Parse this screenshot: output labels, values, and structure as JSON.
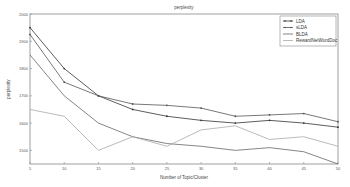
{
  "chart_data": {
    "type": "line",
    "title": "perplexity",
    "xlabel": "Number of Topic/Cluster",
    "ylabel": "perplexity",
    "x": [
      5,
      10,
      15,
      20,
      25,
      30,
      35,
      40,
      45,
      50
    ],
    "xlim": [
      5,
      50
    ],
    "ylim": [
      1450,
      2000
    ],
    "yticks": [
      1500,
      1600,
      1700,
      1800,
      1900,
      2000
    ],
    "xticks": [
      5,
      10,
      15,
      20,
      25,
      30,
      35,
      40,
      45,
      50
    ],
    "grid": false,
    "legend_position": "upper right",
    "series": [
      {
        "name": "LDA",
        "color": "#333333",
        "marker": "dot",
        "values": [
          1950,
          1800,
          1700,
          1650,
          1625,
          1610,
          1600,
          1610,
          1600,
          1585
        ]
      },
      {
        "name": "sLDA",
        "color": "#555555",
        "marker": "plus",
        "values": [
          1925,
          1750,
          1700,
          1670,
          1665,
          1655,
          1625,
          1630,
          1635,
          1605
        ]
      },
      {
        "name": "BLDA",
        "color": "#666666",
        "marker": "none",
        "values": [
          1850,
          1700,
          1600,
          1550,
          1525,
          1515,
          1500,
          1510,
          1495,
          1450
        ]
      },
      {
        "name": "RewardNetWordDoc",
        "color": "#aaaaaa",
        "marker": "none",
        "values": [
          1650,
          1625,
          1500,
          1550,
          1515,
          1575,
          1590,
          1540,
          1550,
          1515
        ]
      }
    ]
  }
}
